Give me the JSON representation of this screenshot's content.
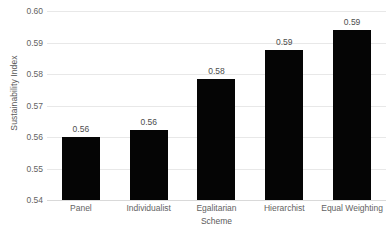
{
  "chart_data": {
    "type": "bar",
    "title": "",
    "xlabel": "Scheme",
    "ylabel": "Sustainability Index",
    "categories": [
      "Panel",
      "Individualist",
      "Egalitarian",
      "Hierarchist",
      "Equal Weighting"
    ],
    "values": [
      0.56,
      0.5623,
      0.5784,
      0.5876,
      0.594
    ],
    "data_labels": [
      "0.56",
      "0.56",
      "0.58",
      "0.59",
      "0.59"
    ],
    "ylim": [
      0.54,
      0.6
    ],
    "ytick_labels": [
      "0.60",
      "0.59",
      "0.58",
      "0.57",
      "0.56",
      "0.55",
      "0.54"
    ],
    "ytick_values": [
      0.6,
      0.59,
      0.58,
      0.57,
      0.56,
      0.55,
      0.54
    ],
    "grid": true,
    "legend": false,
    "legend_position": "none",
    "series": [
      {
        "name": "Sustainability Index",
        "values": [
          0.56,
          0.5623,
          0.5784,
          0.5876,
          0.594
        ]
      }
    ],
    "colors": {
      "bar": "#050505",
      "gridline": "#e8e8e8",
      "baseline": "#d9d9d9",
      "tick_text": "#636363",
      "axis_title_text": "#5a5a5a",
      "data_label_text": "#4d4d4d",
      "background": "#ffffff"
    }
  }
}
